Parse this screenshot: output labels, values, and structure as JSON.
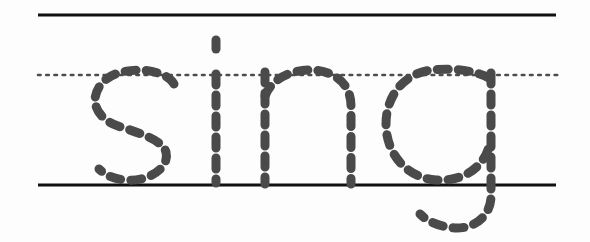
{
  "worksheet": {
    "type": "handwriting-tracing-worksheet",
    "word": "sing",
    "letters": [
      "s",
      "i",
      "n",
      "g"
    ],
    "background_color": "#fdfdfd",
    "canvas": {
      "width": 590,
      "height": 242
    }
  },
  "ruling": {
    "top_line": {
      "label": "top line",
      "color": "#111111",
      "style": "solid",
      "thickness": 3,
      "y": 15,
      "x_start": 38,
      "x_end": 556
    },
    "mid_line": {
      "label": "dotted midline",
      "color": "#4d4d4d",
      "style": "dotted",
      "thickness": 2.6,
      "dash_length": 2.6,
      "dash_gap": 5.6,
      "y": 75,
      "x_start": 38,
      "x_end": 561
    },
    "base_line": {
      "label": "baseline",
      "color": "#111111",
      "style": "solid",
      "thickness": 3,
      "y": 185,
      "x_start": 38,
      "x_end": 556
    }
  },
  "tracing": {
    "stroke_color": "#4a4a4a",
    "stroke_width": 9,
    "dash_length": 11,
    "dash_gap": 10,
    "linecap": "round",
    "glyphs": [
      {
        "letter": "s",
        "name": "letter-s",
        "x_left": 95,
        "x_right": 181,
        "y_top": 72,
        "y_bottom": 186,
        "strokes": [
          "M 174 84 C 166 68 120 64 103 82 C 88 98 95 118 118 126 C 142 134 162 140 166 152 C 170 168 148 182 126 180 C 112 179 104 174 99 169"
        ]
      },
      {
        "letter": "i",
        "name": "letter-i",
        "x_left": 210,
        "x_right": 222,
        "y_top": 38,
        "y_bottom": 184,
        "strokes": [
          "M 216 40 L 216 49",
          "M 216 74 L 216 183"
        ]
      },
      {
        "letter": "n",
        "name": "letter-n",
        "x_left": 262,
        "x_right": 356,
        "y_top": 72,
        "y_bottom": 186,
        "strokes": [
          "M 265 72 L 265 184",
          "M 265 96 C 272 78 292 70 310 70 C 332 70 351 82 351 106 L 351 184"
        ]
      },
      {
        "letter": "g",
        "name": "letter-g",
        "x_left": 383,
        "x_right": 497,
        "y_top": 70,
        "y_bottom": 230,
        "strokes": [
          "M 489 78 C 474 70 452 68 432 70 C 404 73 386 96 386 124 C 386 154 407 178 436 180 C 464 182 486 166 490 142",
          "M 491 73 L 491 196 C 491 216 474 229 455 228 C 441 227 428 222 420 214"
        ]
      }
    ]
  }
}
